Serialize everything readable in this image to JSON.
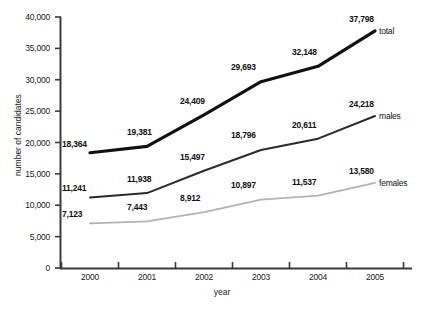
{
  "chart_data": {
    "type": "line",
    "title": "",
    "xlabel": "year",
    "ylabel": "number of candidates",
    "categories": [
      "2000",
      "2001",
      "2002",
      "2003",
      "2004",
      "2005"
    ],
    "ylim": [
      0,
      40000
    ],
    "ytick_values": [
      0,
      5000,
      10000,
      15000,
      20000,
      25000,
      30000,
      35000,
      40000
    ],
    "ytick_labels": [
      "0",
      "5,000",
      "10,000",
      "15,000",
      "20,000",
      "25,000",
      "30,000",
      "35,000",
      "40,000"
    ],
    "grid": false,
    "legend_position": "inline-right-end",
    "series": [
      {
        "name": "total",
        "color": "#111111",
        "width": 3.2,
        "style": "solid",
        "values": [
          18364,
          19381,
          24409,
          29693,
          32148,
          37798
        ],
        "value_labels": [
          "18,364",
          "19,381",
          "24,409",
          "29,693",
          "32,148",
          "37,798"
        ]
      },
      {
        "name": "males",
        "color": "#2b2b2b",
        "width": 2.0,
        "style": "solid",
        "values": [
          11241,
          11938,
          15497,
          18796,
          20611,
          24218
        ],
        "value_labels": [
          "11,241",
          "11,938",
          "15,497",
          "18,796",
          "20,611",
          "24,218"
        ]
      },
      {
        "name": "females",
        "color": "#b3b3b3",
        "width": 1.8,
        "style": "solid",
        "values": [
          7123,
          7443,
          8912,
          10897,
          11537,
          13580
        ],
        "value_labels": [
          "7,123",
          "7,443",
          "8,912",
          "10,897",
          "11,537",
          "13,580"
        ]
      }
    ]
  },
  "axes": {
    "y_title": "number of candidates",
    "x_title": "year"
  },
  "yticks": [
    {
      "label": "40,000"
    },
    {
      "label": "35,000"
    },
    {
      "label": "30,000"
    },
    {
      "label": "25,000"
    },
    {
      "label": "20,000"
    },
    {
      "label": "15,000"
    },
    {
      "label": "10,000"
    },
    {
      "label": "5,000"
    },
    {
      "label": "0"
    }
  ],
  "xticks": [
    {
      "label": "2000"
    },
    {
      "label": "2001"
    },
    {
      "label": "2002"
    },
    {
      "label": "2003"
    },
    {
      "label": "2004"
    },
    {
      "label": "2005"
    }
  ],
  "series_end_labels": [
    {
      "label": "total"
    },
    {
      "label": "males"
    },
    {
      "label": "females"
    }
  ],
  "point_labels": {
    "total": [
      "18,364",
      "19,381",
      "24,409",
      "29,693",
      "32,148",
      "37,798"
    ],
    "males": [
      "11,241",
      "11,938",
      "15,497",
      "18,796",
      "20,611",
      "24,218"
    ],
    "females": [
      "7,123",
      "7,443",
      "8,912",
      "10,897",
      "11,537",
      "13,580"
    ]
  },
  "colors": {
    "total": "#111111",
    "males": "#2b2b2b",
    "females": "#b3b3b3",
    "axis": "#3a3a3a",
    "text": "#111111",
    "background": "#ffffff"
  }
}
